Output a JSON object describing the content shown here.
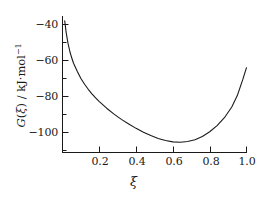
{
  "chart_data": {
    "type": "line",
    "title": "",
    "subtitle": "",
    "xlabel": "ξ",
    "ylabel": "G(ξ) / kJ·mol⁻¹",
    "ylabel_parts": {
      "symbol": "G",
      "open_paren": "(",
      "variable": "ξ",
      "close_paren": ")",
      "separator": " / ",
      "unit_base": "kJ·mol",
      "unit_exponent": "−1"
    },
    "xlim": [
      0.0,
      1.0
    ],
    "ylim": [
      -110,
      -36
    ],
    "grid": false,
    "legend": null,
    "xticks": [
      0.2,
      0.4,
      0.6,
      0.8,
      1.0
    ],
    "xtick_labels": [
      "0.2",
      "0.4",
      "0.6",
      "0.8",
      "1.0"
    ],
    "xticks_minor": [
      0.1,
      0.3,
      0.5,
      0.7,
      0.9
    ],
    "yticks": [
      -40,
      -60,
      -80,
      -100
    ],
    "ytick_labels": [
      "−40",
      "−60",
      "−80",
      "−100"
    ],
    "yticks_minor": [
      -50,
      -70,
      -90,
      -110
    ],
    "line_color": "#1a1a1a",
    "axis_color": "#1a1a1a",
    "minimum": {
      "x": 0.56,
      "y": -107.0
    },
    "endpoints": {
      "start": {
        "x": 0.012,
        "y": -38.0
      },
      "end": {
        "x": 1.0,
        "y": -64.0
      }
    },
    "x": [
      0.012,
      0.02,
      0.03,
      0.04,
      0.05,
      0.06,
      0.08,
      0.1,
      0.12,
      0.14,
      0.16,
      0.18,
      0.2,
      0.24,
      0.28,
      0.32,
      0.36,
      0.4,
      0.44,
      0.48,
      0.52,
      0.56,
      0.6,
      0.64,
      0.68,
      0.72,
      0.76,
      0.8,
      0.84,
      0.88,
      0.92,
      0.95,
      0.98,
      1.0
    ],
    "y": [
      -38.0,
      -44.5,
      -50.5,
      -55.0,
      -58.5,
      -61.5,
      -66.0,
      -70.0,
      -73.2,
      -76.0,
      -78.5,
      -80.8,
      -82.8,
      -86.5,
      -89.8,
      -92.7,
      -95.3,
      -97.7,
      -99.8,
      -101.7,
      -103.3,
      -104.4,
      -105.2,
      -105.4,
      -105.0,
      -104.0,
      -102.2,
      -99.6,
      -96.2,
      -91.8,
      -85.8,
      -79.5,
      -70.5,
      -64.0
    ]
  }
}
